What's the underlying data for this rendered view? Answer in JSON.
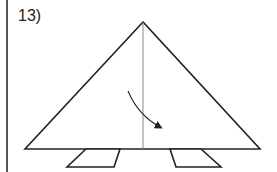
{
  "step": {
    "label": "13)"
  },
  "diagram": {
    "stroke_color": "#222222",
    "crease_color": "#888888",
    "triangle": {
      "apex": [
        143,
        22
      ],
      "left": [
        25,
        149
      ],
      "right": [
        260,
        149
      ]
    },
    "crease_line": {
      "x": 143,
      "y1": 22,
      "y2": 149
    },
    "arrow": {
      "from": [
        128,
        91
      ],
      "to": [
        162,
        128
      ],
      "direction": "down-right",
      "meaning": "fold"
    },
    "flaps": [
      {
        "name": "left-flap",
        "points": [
          [
            86,
            149
          ],
          [
            120,
            149
          ],
          [
            114,
            167
          ],
          [
            67,
            167
          ]
        ]
      },
      {
        "name": "right-flap",
        "points": [
          [
            170,
            149
          ],
          [
            201,
            149
          ],
          [
            221,
            167
          ],
          [
            176,
            167
          ]
        ]
      }
    ]
  }
}
